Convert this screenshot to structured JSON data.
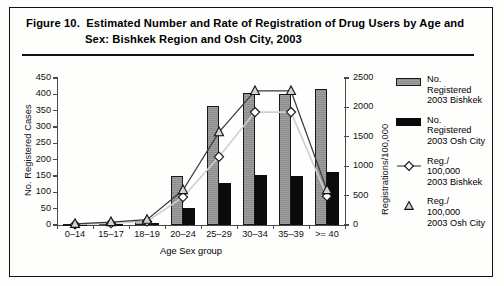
{
  "figure": {
    "title_line1": "Figure 10.  Estimated Number and Rate of Registration of Drug Users by Age and",
    "title_line2": "Sex: Bishkek Region and Osh City, 2003"
  },
  "colors": {
    "bar_bishkek": "#8d8d8d",
    "bar_osh": "#0b0b0b",
    "axis": "#4a4a4a",
    "line_bishkek": "#cfcfcf",
    "line_osh": "#3a3a3a",
    "frame": "#111111"
  },
  "legend": {
    "position": "right",
    "items": [
      {
        "symbol": "grey-bar-swatch",
        "lines": [
          "No.",
          "Registered",
          "2003 Bishkek"
        ]
      },
      {
        "symbol": "black-bar-swatch",
        "lines": [
          "No.",
          "Registered",
          "2003 Osh City"
        ]
      },
      {
        "symbol": "diamond-line-marker",
        "lines": [
          "Reg./",
          "100,000",
          "2003 Bishkek"
        ]
      },
      {
        "symbol": "triangle-line-marker",
        "lines": [
          "Reg./",
          "100,000",
          "2003 Osh City"
        ]
      }
    ]
  },
  "chart_data": {
    "type": "bar",
    "title": "Estimated Number and Rate of Registration of Drug Users by Age and Sex: Bishkek Region and Osh City, 2003",
    "xlabel": "Age Sex group",
    "ylabel": "No. Registered Cases",
    "y2label": "Registrations/100,000",
    "grid": false,
    "legend_position": "right",
    "categories": [
      "0–14",
      "15–17",
      "18–19",
      "20–24",
      "25–29",
      "30–34",
      "35–39",
      ">= 40"
    ],
    "ylim": [
      0,
      450
    ],
    "yticks": [
      0,
      50,
      100,
      150,
      200,
      250,
      300,
      350,
      400,
      450
    ],
    "y2lim": [
      0,
      2500
    ],
    "y2ticks": [
      0,
      500,
      1000,
      1500,
      2000,
      2500
    ],
    "series": [
      {
        "name": "No. Registered 2003 Bishkek",
        "kind": "bar",
        "axis": "left",
        "values": [
          2,
          6,
          12,
          150,
          365,
          405,
          400,
          415
        ]
      },
      {
        "name": "No. Registered 2003 Osh City",
        "kind": "bar",
        "axis": "left",
        "values": [
          1,
          3,
          6,
          52,
          128,
          153,
          150,
          162
        ]
      },
      {
        "name": "Reg./100,000 2003 Bishkek",
        "kind": "line",
        "marker": "diamond",
        "axis": "right",
        "values": [
          10,
          30,
          60,
          475,
          1160,
          1920,
          1920,
          490
        ]
      },
      {
        "name": "Reg./100,000 2003 Osh City",
        "kind": "line",
        "marker": "triangle",
        "axis": "right",
        "values": [
          20,
          50,
          90,
          595,
          1580,
          2280,
          2280,
          595
        ]
      }
    ]
  }
}
